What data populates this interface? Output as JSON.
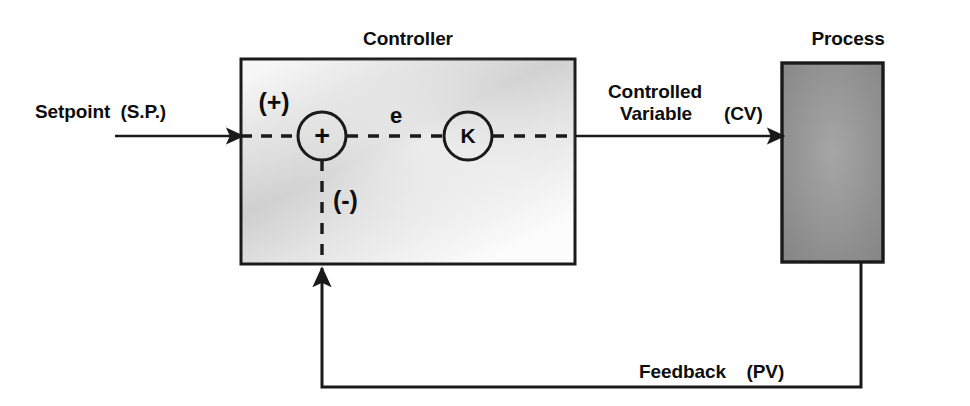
{
  "diagram": {
    "type": "control-system-block-diagram",
    "canvas": {
      "width": 970,
      "height": 406,
      "background": "#ffffff"
    }
  },
  "blocks": {
    "controller": {
      "label": "Controller",
      "x": 241,
      "y": 59,
      "width": 334,
      "height": 205,
      "fill_light": "#fbfbfb",
      "fill_mid": "#c9c9c9",
      "border": "#1a1a1a"
    },
    "process": {
      "label": "Process",
      "x": 782,
      "y": 63,
      "width": 101,
      "height": 199,
      "fill": "#8e8e8e",
      "fill_center": "#a2a2a2",
      "border": "#1a1a1a"
    }
  },
  "nodes": {
    "summing_junction": {
      "glyph": "+",
      "name": "summing-junction",
      "cx": 322,
      "cy": 136,
      "r": 24
    },
    "gain": {
      "glyph": "K",
      "name": "gain-block",
      "cx": 468,
      "cy": 136,
      "r": 24
    }
  },
  "signals": {
    "setpoint": {
      "label": "Setpoint",
      "tag": "(S.P.)",
      "full": "Setpoint  (S.P.)"
    },
    "error": {
      "label": "e"
    },
    "controlled_variable": {
      "line1": "Controlled",
      "line2": "Variable",
      "tag": "(CV)"
    },
    "feedback": {
      "label": "Feedback",
      "tag": "(PV)",
      "full": "Feedback    (PV)"
    }
  },
  "signs": {
    "positive": "(+)",
    "negative": "(-)"
  },
  "colors": {
    "stroke": "#1a1a1a",
    "text": "#0d0d0d",
    "background": "#ffffff"
  }
}
